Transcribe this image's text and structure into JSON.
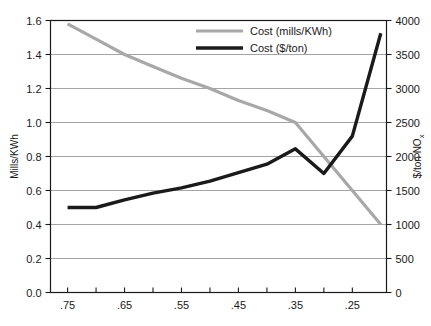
{
  "chart_data": {
    "type": "line",
    "title": "",
    "xlabel": "",
    "ylabel": "Mills/KWh",
    "y2label": "$/ton NOx",
    "y2label_base": "$/ton NO",
    "y2label_sub": "x",
    "grid": true,
    "legend_position": "top-center",
    "x": [
      0.75,
      0.7,
      0.65,
      0.6,
      0.55,
      0.5,
      0.45,
      0.4,
      0.35,
      0.3,
      0.25,
      0.2
    ],
    "xlim": [
      0.78,
      0.19
    ],
    "x_ticks": [
      0.75,
      0.7,
      0.65,
      0.6,
      0.55,
      0.5,
      0.45,
      0.4,
      0.35,
      0.3,
      0.25
    ],
    "x_tick_labels": [
      ".75",
      "",
      ".65",
      "",
      ".55",
      "",
      ".45",
      "",
      ".35",
      "",
      ".25"
    ],
    "ylim": [
      0.0,
      1.6
    ],
    "y_ticks": [
      0.0,
      0.2,
      0.4,
      0.6,
      0.8,
      1.0,
      1.2,
      1.4,
      1.6
    ],
    "y_tick_labels": [
      "0.0",
      "0.2",
      "0.4",
      "0.6",
      "0.8",
      "1.0",
      "1.2",
      "1.4",
      "1.6"
    ],
    "y2lim": [
      0,
      4000
    ],
    "y2_ticks": [
      0,
      500,
      1000,
      1500,
      2000,
      2500,
      3000,
      3500,
      4000
    ],
    "y2_tick_labels": [
      "0",
      "500",
      "1000",
      "1500",
      "2000",
      "2500",
      "3000",
      "3500",
      "4000"
    ],
    "series": [
      {
        "name": "Cost (mills/KWh)",
        "axis": "left",
        "color": "#a8a8a8",
        "width": 3.2,
        "values": [
          1.58,
          1.49,
          1.4,
          1.33,
          1.26,
          1.2,
          1.13,
          1.07,
          1.0,
          0.8,
          0.6,
          0.4
        ]
      },
      {
        "name": "Cost ($/ton)",
        "axis": "left",
        "color": "#1a1a1a",
        "width": 3.4,
        "values": [
          0.5,
          0.5,
          0.545,
          0.585,
          0.615,
          0.655,
          0.705,
          0.755,
          0.845,
          0.7,
          0.92,
          1.525
        ]
      }
    ],
    "series_right_values": [
      {
        "name": "Cost ($/ton)",
        "values": [
          1250,
          1250,
          1363,
          1463,
          1538,
          1638,
          1763,
          1888,
          2113,
          1750,
          2300,
          3813
        ]
      }
    ],
    "legend": [
      {
        "label": "Cost (mills/KWh)",
        "color": "#a8a8a8"
      },
      {
        "label": "Cost ($/ton)",
        "color": "#1a1a1a"
      }
    ]
  }
}
